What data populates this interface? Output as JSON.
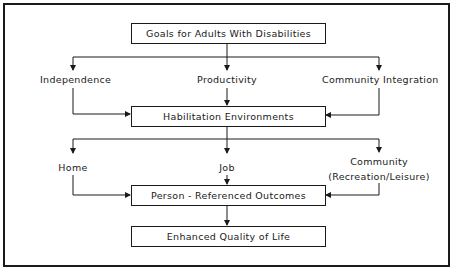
{
  "diagram": {
    "boxes": {
      "goals": "Goals for Adults With Disabilities",
      "habilitation": "Habilitation Environments",
      "outcomes": "Person - Referenced Outcomes",
      "quality": "Enhanced Quality of Life"
    },
    "goals_branches": {
      "left": "Independence",
      "center": "Productivity",
      "right": "Community Integration"
    },
    "environment_branches": {
      "left": "Home",
      "center": "Job",
      "right_line1": "Community",
      "right_line2": "(Recreation/Leisure)"
    }
  }
}
